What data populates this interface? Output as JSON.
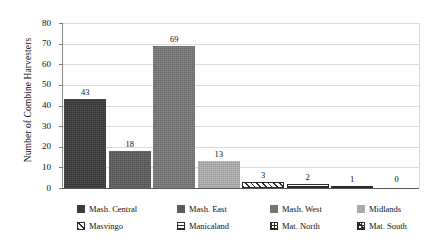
{
  "chart_data": {
    "type": "bar",
    "title": "",
    "xlabel": "",
    "ylabel": "Number of Combine Harvesters",
    "ylim": [
      0,
      80
    ],
    "yticks": [
      0,
      10,
      20,
      30,
      40,
      50,
      60,
      70,
      80
    ],
    "grid": true,
    "legend_position": "bottom",
    "categories": [
      "Mash. Central",
      "Mash. East",
      "Mash. West",
      "Midlands",
      "Masvingo",
      "Manicaland",
      "Mat. North",
      "Mat. South"
    ],
    "values": [
      43,
      18,
      69,
      13,
      3,
      2,
      1,
      0
    ],
    "value_labels": [
      "43",
      "18",
      "69",
      "13",
      "3",
      "2",
      "1",
      "0"
    ],
    "series": [
      {
        "name": "Number of Combine Harvesters",
        "values": [
          43,
          18,
          69,
          13,
          3,
          2,
          1,
          0
        ]
      }
    ],
    "bar_styles": [
      {
        "name": "Mash. Central",
        "pattern": "solid",
        "color": "#3b3b3b"
      },
      {
        "name": "Mash. East",
        "pattern": "solid",
        "color": "#5c5c5c"
      },
      {
        "name": "Mash. West",
        "pattern": "solid",
        "color": "#767676"
      },
      {
        "name": "Midlands",
        "pattern": "solid",
        "color": "#ababab"
      },
      {
        "name": "Masvingo",
        "pattern": "diagonal-hatch",
        "color": "#2b2b2b"
      },
      {
        "name": "Manicaland",
        "pattern": "horizontal-lines",
        "color": "#2b2b2b"
      },
      {
        "name": "Mat. North",
        "pattern": "cross-hatch",
        "color": "#2b2b2b"
      },
      {
        "name": "Mat. South",
        "pattern": "dense-cross",
        "color": "#2b2b2b"
      }
    ]
  },
  "axis": {
    "ylabel": "Number of Combine Harvesters",
    "ytick_labels": [
      "0",
      "10",
      "20",
      "30",
      "40",
      "50",
      "60",
      "70",
      "80"
    ]
  },
  "legend": {
    "row1": [
      {
        "label": "Mash. Central",
        "pattern": "solid",
        "color": "#3b3b3b"
      },
      {
        "label": "Mash. East",
        "pattern": "solid",
        "color": "#5c5c5c"
      },
      {
        "label": "Mash. West",
        "pattern": "solid",
        "color": "#767676"
      },
      {
        "label": "Midlands",
        "pattern": "solid",
        "color": "#ababab"
      }
    ],
    "row2": [
      {
        "label": "Masvingo",
        "pattern": "diagonal-hatch",
        "color": "#2b2b2b"
      },
      {
        "label": "Manicaland",
        "pattern": "horizontal-lines",
        "color": "#2b2b2b"
      },
      {
        "label": "Mat. North",
        "pattern": "cross-hatch",
        "color": "#2b2b2b"
      },
      {
        "label": "Mat. South",
        "pattern": "dense-cross",
        "color": "#2b2b2b"
      }
    ]
  },
  "colors": {
    "background": "#ffffff",
    "gridline": "#dcdcdc",
    "axis": "#555555",
    "text": "#111111"
  }
}
